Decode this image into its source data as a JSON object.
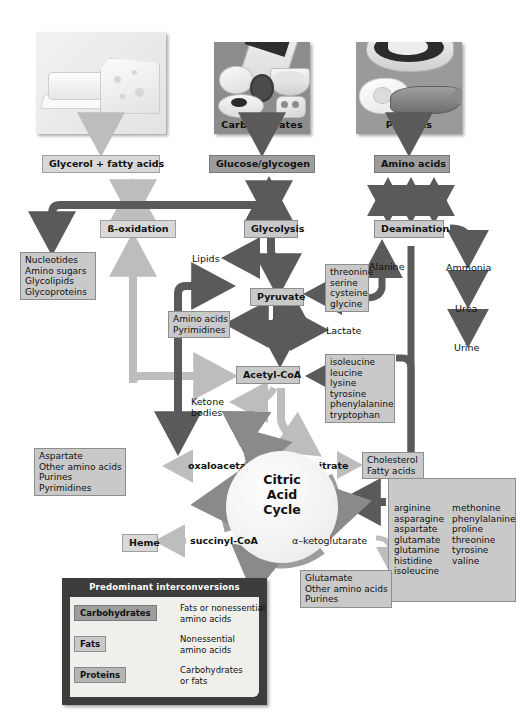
{
  "sources": [
    {
      "id": "fats",
      "caption": "Fats",
      "product": "Glycerol + fatty acids"
    },
    {
      "id": "carbohydrates",
      "caption": "Carbohydrates",
      "product": "Glucose/glycogen"
    },
    {
      "id": "proteins",
      "caption": "Proteins",
      "product": "Amino acids"
    }
  ],
  "processes": {
    "beta_oxidation": "ß-oxidation",
    "glycolysis": "Glycolysis",
    "deamination": "Deamination"
  },
  "metabolites": {
    "pyruvate": "Pyruvate",
    "acetyl_coa": "Acetyl-CoA",
    "oxaloacetate": "oxaloacetate",
    "citrate": "citrate",
    "succinyl_coa": "succinyl-CoA",
    "alpha_ketoglutarate": "α–ketoglutarate",
    "lipids": "Lipids",
    "lactate": "Lactate",
    "alanine": "Alanine",
    "ketone_bodies": "Ketone\nbodies",
    "ammonia": "Ammonia",
    "urea": "Urea",
    "urine": "Urine",
    "heme": "Heme"
  },
  "cycle": {
    "line1": "Citric",
    "line2": "Acid",
    "line3": "Cycle"
  },
  "product_boxes": {
    "nucleotides": "Nucleotides\nAmino sugars\nGlycolipids\nGlycoproteins",
    "amino_acids_pyrimidines": "Amino acids\nPyrimidines",
    "aspartate_group": "Aspartate\nOther amino acids\nPurines\nPyrimidines",
    "cholesterol_fatty_acids": "Cholesterol\nFatty acids",
    "glutamate_group": "Glutamate\nOther amino acids\nPurines",
    "threonine_group": "threonine\nserine\ncysteine\nglycine",
    "ketogenic_group": "isoleucine\nleucine\nlysine\ntyrosine\nphenylalanine\ntryptophan",
    "glucogenic_col1": "arginine\nasparagine\naspartate\nglutamate\nglutamine\nhistidine\nisoleucine",
    "glucogenic_col2": "methonine\nphenylalanine\nproline\nthreonine\ntyrosine\nvaline"
  },
  "legend": {
    "title": "Predominant interconversions",
    "rows": [
      {
        "chip": "Carbohydrates",
        "text": "Fats or nonessential\namino acids",
        "arrow_color": "#3a3a3a"
      },
      {
        "chip": "Fats",
        "text": "Nonessential\namino acids",
        "arrow_color": "#b9b9b9"
      },
      {
        "chip": "Proteins",
        "text": "Carbohydrates\nor fats",
        "arrow_color": "#9a9a9a"
      }
    ]
  },
  "colors": {
    "arrow_dark": "#5a5a5a",
    "arrow_mid": "#8a8a8a",
    "arrow_light": "#bdbdbd",
    "box_fill": "#c9c9c9",
    "box_stroke": "#8e8e8e",
    "cycle_ring": "#9d9d9d",
    "legend_bg": "#3d3d3d"
  }
}
